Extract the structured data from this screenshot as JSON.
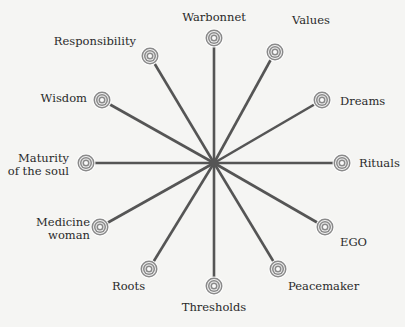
{
  "diagram": {
    "type": "radial-wheel",
    "center": {
      "x": 214,
      "y": 163
    },
    "colors": {
      "spoke": "#555555",
      "ring": "#8a8a8a",
      "background": "#f5f5f3",
      "text": "#2a2a2a"
    },
    "nodes": [
      {
        "id": "warbonnet",
        "label": "Warbonnet",
        "x": 214,
        "y": 38
      },
      {
        "id": "values",
        "label": "Values",
        "x": 275,
        "y": 52
      },
      {
        "id": "dreams",
        "label": "Dreams",
        "x": 322,
        "y": 100
      },
      {
        "id": "rituals",
        "label": "Rituals",
        "x": 342,
        "y": 163
      },
      {
        "id": "ego",
        "label": "EGO",
        "x": 325,
        "y": 227
      },
      {
        "id": "peacemaker",
        "label": "Peacemaker",
        "x": 278,
        "y": 269
      },
      {
        "id": "thresholds",
        "label": "Thresholds",
        "x": 214,
        "y": 286
      },
      {
        "id": "roots",
        "label": "Roots",
        "x": 149,
        "y": 269
      },
      {
        "id": "medicine-woman",
        "label_line1": "Medicine",
        "label_line2": "woman",
        "x": 100,
        "y": 227
      },
      {
        "id": "maturity",
        "label_line1": "Maturity",
        "label_line2": "of the soul",
        "x": 86,
        "y": 163
      },
      {
        "id": "wisdom",
        "label": "Wisdom",
        "x": 102,
        "y": 100
      },
      {
        "id": "responsibility",
        "label": "Responsibility",
        "x": 150,
        "y": 56
      }
    ]
  }
}
